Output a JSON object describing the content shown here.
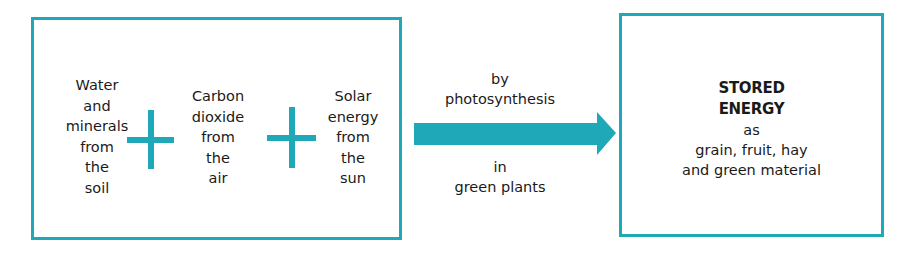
{
  "diagram": {
    "colors": {
      "accent": "#1fa8b8",
      "text": "#1a1a1a",
      "background": "#ffffff"
    },
    "inputs": [
      {
        "lines": [
          "Water",
          "and",
          "minerals",
          "from",
          "the",
          "soil"
        ]
      },
      {
        "lines": [
          "Carbon",
          "dioxide",
          "from",
          "the",
          "air"
        ]
      },
      {
        "lines": [
          "Solar",
          "energy",
          "from",
          "the",
          "sun"
        ]
      }
    ],
    "operators": [
      "plus-icon",
      "plus-icon"
    ],
    "arrow": {
      "label_above": [
        "by",
        "photosynthesis"
      ],
      "label_below": [
        "in",
        "green plants"
      ]
    },
    "output": {
      "title_lines": [
        "STORED",
        "ENERGY"
      ],
      "detail_lines": [
        "as",
        "grain, fruit, hay",
        "and green material"
      ]
    }
  }
}
